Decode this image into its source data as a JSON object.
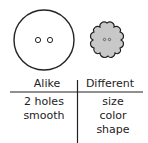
{
  "objects": {
    "large_button": {
      "shape": "circle",
      "holes": 2,
      "fill": "#ffffff"
    },
    "small_button": {
      "shape": "flower",
      "holes": 2,
      "fill": "#c8c8c8"
    }
  },
  "t_chart": {
    "headers": [
      "Alike",
      "Different"
    ],
    "alike": [
      "2 holes",
      "smooth"
    ],
    "different": [
      "size",
      "color",
      "shape"
    ]
  }
}
